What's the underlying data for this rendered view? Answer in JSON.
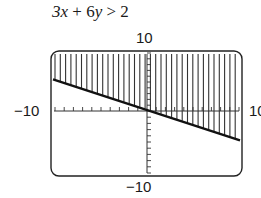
{
  "problem": {
    "marker": ")",
    "inequality": "3x + 6y > 2"
  },
  "chart_data": {
    "type": "line",
    "title": "3x + 6y > 2",
    "boundary": {
      "equation": "y = 1/3 - x/2",
      "style": "solid"
    },
    "x": [
      -10,
      10
    ],
    "y": [
      5.333,
      -4.667
    ],
    "shading": "above boundary line (vertical hatching)",
    "xlim": [
      -10,
      10
    ],
    "ylim": [
      -10,
      10
    ],
    "x_tick_labels": {
      "min": "-10",
      "max": "10"
    },
    "y_tick_labels": {
      "min": "-10",
      "max": "10"
    },
    "tick_step": 1,
    "grid": false,
    "legend": null
  },
  "axes": {
    "ymax_label": "10",
    "ymin_label": "-10",
    "xmin_label": "−10",
    "xmax_label": "10",
    "ymin_display": "−10"
  }
}
